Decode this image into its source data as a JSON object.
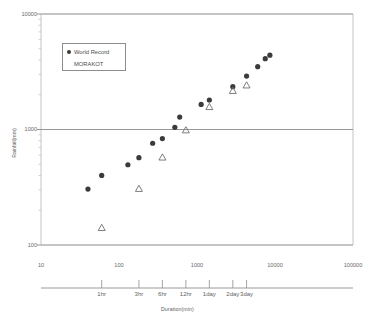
{
  "chart_data": {
    "type": "scatter",
    "title": "",
    "xlabel": "Duration(min)",
    "ylabel": "Rainfall(mm)",
    "xscale": "log",
    "yscale": "log",
    "xlim": [
      10,
      100000
    ],
    "ylim": [
      100,
      10000
    ],
    "grid": false,
    "legend_position": "upper-left",
    "x_tick_labels": [
      "10",
      "100",
      "1000",
      "10000",
      "100000"
    ],
    "x_tick_values": [
      10,
      100,
      1000,
      10000,
      100000
    ],
    "y_tick_labels": [
      "100",
      "1000",
      "10000"
    ],
    "y_tick_values": [
      100,
      1000,
      10000
    ],
    "secondary_axis": {
      "name": "duration-axis",
      "label": "Duration(min)",
      "ticks": [
        {
          "label": "1hr",
          "value": 60
        },
        {
          "label": "3hr",
          "value": 180
        },
        {
          "label": "6hr",
          "value": 360
        },
        {
          "label": "12hr",
          "value": 720
        },
        {
          "label": "1day",
          "value": 1440
        },
        {
          "label": "2day",
          "value": 2880
        },
        {
          "label": "3day",
          "value": 4320
        }
      ]
    },
    "series": [
      {
        "name": "World Record",
        "marker": "filled-circle",
        "color": "#3b3b3b",
        "points": [
          {
            "x": 40,
            "y": 305
          },
          {
            "x": 60,
            "y": 400
          },
          {
            "x": 130,
            "y": 495
          },
          {
            "x": 180,
            "y": 570
          },
          {
            "x": 270,
            "y": 760
          },
          {
            "x": 360,
            "y": 835
          },
          {
            "x": 520,
            "y": 1045
          },
          {
            "x": 600,
            "y": 1280
          },
          {
            "x": 1130,
            "y": 1650
          },
          {
            "x": 1440,
            "y": 1800
          },
          {
            "x": 2880,
            "y": 2350
          },
          {
            "x": 4320,
            "y": 2900
          },
          {
            "x": 6000,
            "y": 3500
          },
          {
            "x": 7500,
            "y": 4100
          },
          {
            "x": 8600,
            "y": 4400
          }
        ]
      },
      {
        "name": "MORAKOT",
        "marker": "open-triangle",
        "color": "#6f6f6f",
        "points": [
          {
            "x": 60,
            "y": 140
          },
          {
            "x": 180,
            "y": 305
          },
          {
            "x": 360,
            "y": 570
          },
          {
            "x": 720,
            "y": 980
          },
          {
            "x": 1440,
            "y": 1560
          },
          {
            "x": 2880,
            "y": 2150
          },
          {
            "x": 4320,
            "y": 2400
          }
        ]
      }
    ]
  },
  "legend": {
    "entries": [
      {
        "label": "World Record",
        "marker": "filled-circle"
      },
      {
        "label": "MORAKOT",
        "marker": "open-triangle"
      }
    ]
  },
  "axes": {
    "y_label": "Rainfall(mm)",
    "x_label": "Duration(min)"
  }
}
